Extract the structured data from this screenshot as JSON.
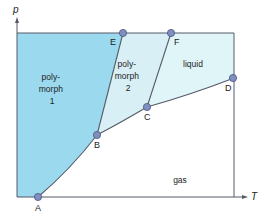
{
  "diagram": {
    "title": "",
    "axes": {
      "x_label": "T",
      "y_label": "p"
    },
    "colors": {
      "polymorph1": "#9ad9ee",
      "polymorph2": "#d8eff5",
      "liquid": "#e0f5f8",
      "gas": "#ffffff",
      "line": "#555b66",
      "point_fill": "#7f8fc2",
      "point_stroke": "#4a5578"
    },
    "points": [
      {
        "id": "A",
        "label": "A"
      },
      {
        "id": "B",
        "label": "B"
      },
      {
        "id": "C",
        "label": "C"
      },
      {
        "id": "D",
        "label": "D"
      },
      {
        "id": "E",
        "label": "E"
      },
      {
        "id": "F",
        "label": "F"
      }
    ],
    "regions": {
      "polymorph1": [
        "poly-",
        "morph",
        "1"
      ],
      "polymorph2": [
        "poly-",
        "morph",
        "2"
      ],
      "liquid": [
        "liquid"
      ],
      "gas": [
        "gas"
      ]
    },
    "lines": [
      {
        "from": "A",
        "to": "B",
        "meaning": "polymorph 1 / gas boundary"
      },
      {
        "from": "B",
        "to": "E",
        "meaning": "polymorph 1 / polymorph 2 boundary"
      },
      {
        "from": "B",
        "to": "C",
        "meaning": "polymorph 2 / gas boundary"
      },
      {
        "from": "C",
        "to": "F",
        "meaning": "polymorph 2 / liquid boundary"
      },
      {
        "from": "C",
        "to": "D",
        "meaning": "liquid / gas boundary"
      }
    ]
  }
}
